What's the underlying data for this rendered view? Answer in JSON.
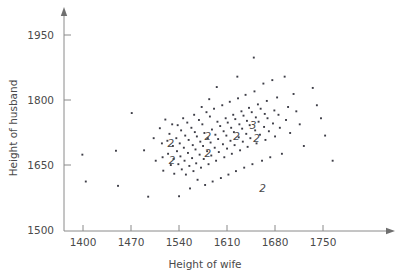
{
  "chart_data": {
    "type": "scatter",
    "title": "",
    "xlabel": "Height of wife",
    "ylabel": "Height of husband",
    "xlim": [
      1358,
      1790
    ],
    "ylim": [
      1500,
      1975
    ],
    "xticks": [
      1400,
      1470,
      1540,
      1610,
      1680,
      1750
    ],
    "yticks": [
      1500,
      1650,
      1800,
      1950
    ],
    "xtick_labels": [
      "1400",
      "1470",
      "1540",
      "1610",
      "1680",
      "1750"
    ],
    "ytick_labels": [
      "1500",
      "1650",
      "1800",
      "1950"
    ],
    "grid": false,
    "legend": false,
    "marker": "square-dot",
    "marker_color": "#3d3d46",
    "axis_color": "#8a8a8a",
    "text_color": "#4a4a4a",
    "note": "Counts greater than 1 at a coincident location are drawn as a numeral instead of a dot.",
    "points": [
      [
        1399,
        1674
      ],
      [
        1404,
        1612
      ],
      [
        1448,
        1683
      ],
      [
        1451,
        1602
      ],
      [
        1471,
        1770
      ],
      [
        1489,
        1684
      ],
      [
        1495,
        1577
      ],
      [
        1503,
        1712
      ],
      [
        1506,
        1660
      ],
      [
        1512,
        1735
      ],
      [
        1515,
        1700
      ],
      [
        1516,
        1668
      ],
      [
        1517,
        1637
      ],
      [
        1520,
        1755
      ],
      [
        1523,
        1706
      ],
      [
        1524,
        1676
      ],
      [
        1526,
        1722
      ],
      [
        1528,
        1650
      ],
      [
        1530,
        1744
      ],
      [
        1531,
        1694
      ],
      [
        1532,
        1664
      ],
      [
        1533,
        1630
      ],
      [
        1536,
        1712
      ],
      [
        1537,
        1682
      ],
      [
        1538,
        1742
      ],
      [
        1539,
        1652
      ],
      [
        1540,
        1578
      ],
      [
        1541,
        1700
      ],
      [
        1542,
        1670
      ],
      [
        1543,
        1730
      ],
      [
        1544,
        1640
      ],
      [
        1546,
        1758
      ],
      [
        1547,
        1690
      ],
      [
        1548,
        1660
      ],
      [
        1549,
        1718
      ],
      [
        1550,
        1628
      ],
      [
        1552,
        1748
      ],
      [
        1553,
        1678
      ],
      [
        1554,
        1708
      ],
      [
        1555,
        1648
      ],
      [
        1556,
        1596
      ],
      [
        1558,
        1736
      ],
      [
        1559,
        1666
      ],
      [
        1560,
        1696
      ],
      [
        1561,
        1636
      ],
      [
        1562,
        1766
      ],
      [
        1563,
        1726
      ],
      [
        1564,
        1686
      ],
      [
        1565,
        1654
      ],
      [
        1566,
        1716
      ],
      [
        1567,
        1616
      ],
      [
        1569,
        1754
      ],
      [
        1570,
        1674
      ],
      [
        1571,
        1704
      ],
      [
        1572,
        1644
      ],
      [
        1573,
        1784
      ],
      [
        1574,
        1744
      ],
      [
        1575,
        1694
      ],
      [
        1576,
        1664
      ],
      [
        1577,
        1724
      ],
      [
        1578,
        1604
      ],
      [
        1580,
        1772
      ],
      [
        1581,
        1682
      ],
      [
        1582,
        1712
      ],
      [
        1583,
        1652
      ],
      [
        1584,
        1802
      ],
      [
        1585,
        1762
      ],
      [
        1586,
        1702
      ],
      [
        1587,
        1672
      ],
      [
        1588,
        1732
      ],
      [
        1589,
        1612
      ],
      [
        1591,
        1780
      ],
      [
        1592,
        1690
      ],
      [
        1593,
        1720
      ],
      [
        1594,
        1660
      ],
      [
        1595,
        1830
      ],
      [
        1596,
        1750
      ],
      [
        1597,
        1710
      ],
      [
        1598,
        1680
      ],
      [
        1600,
        1740
      ],
      [
        1601,
        1620
      ],
      [
        1603,
        1788
      ],
      [
        1604,
        1698
      ],
      [
        1605,
        1728
      ],
      [
        1606,
        1668
      ],
      [
        1608,
        1758
      ],
      [
        1609,
        1718
      ],
      [
        1610,
        1688
      ],
      [
        1611,
        1748
      ],
      [
        1612,
        1628
      ],
      [
        1614,
        1796
      ],
      [
        1615,
        1706
      ],
      [
        1616,
        1736
      ],
      [
        1617,
        1676
      ],
      [
        1619,
        1766
      ],
      [
        1620,
        1726
      ],
      [
        1621,
        1696
      ],
      [
        1622,
        1756
      ],
      [
        1623,
        1636
      ],
      [
        1625,
        1854
      ],
      [
        1626,
        1804
      ],
      [
        1627,
        1714
      ],
      [
        1628,
        1744
      ],
      [
        1629,
        1684
      ],
      [
        1631,
        1774
      ],
      [
        1632,
        1734
      ],
      [
        1633,
        1704
      ],
      [
        1634,
        1764
      ],
      [
        1635,
        1644
      ],
      [
        1637,
        1812
      ],
      [
        1638,
        1722
      ],
      [
        1639,
        1752
      ],
      [
        1640,
        1692
      ],
      [
        1642,
        1782
      ],
      [
        1643,
        1742
      ],
      [
        1644,
        1712
      ],
      [
        1646,
        1772
      ],
      [
        1647,
        1652
      ],
      [
        1649,
        1898
      ],
      [
        1650,
        1820
      ],
      [
        1651,
        1730
      ],
      [
        1652,
        1760
      ],
      [
        1653,
        1700
      ],
      [
        1655,
        1790
      ],
      [
        1656,
        1750
      ],
      [
        1658,
        1720
      ],
      [
        1659,
        1780
      ],
      [
        1661,
        1660
      ],
      [
        1663,
        1838
      ],
      [
        1664,
        1738
      ],
      [
        1665,
        1768
      ],
      [
        1666,
        1708
      ],
      [
        1668,
        1798
      ],
      [
        1669,
        1758
      ],
      [
        1671,
        1728
      ],
      [
        1673,
        1668
      ],
      [
        1676,
        1846
      ],
      [
        1677,
        1746
      ],
      [
        1679,
        1776
      ],
      [
        1680,
        1716
      ],
      [
        1683,
        1806
      ],
      [
        1685,
        1766
      ],
      [
        1687,
        1736
      ],
      [
        1690,
        1676
      ],
      [
        1694,
        1854
      ],
      [
        1696,
        1754
      ],
      [
        1699,
        1784
      ],
      [
        1702,
        1724
      ],
      [
        1707,
        1814
      ],
      [
        1711,
        1774
      ],
      [
        1716,
        1744
      ],
      [
        1722,
        1694
      ],
      [
        1735,
        1828
      ],
      [
        1741,
        1788
      ],
      [
        1747,
        1758
      ],
      [
        1753,
        1718
      ],
      [
        1764,
        1660
      ]
    ],
    "count_labels": [
      {
        "x": 1528,
        "y": 1700,
        "count": "2"
      },
      {
        "x": 1530,
        "y": 1660,
        "count": "2"
      },
      {
        "x": 1582,
        "y": 1716,
        "count": "2"
      },
      {
        "x": 1582,
        "y": 1678,
        "count": "2"
      },
      {
        "x": 1624,
        "y": 1716,
        "count": "2"
      },
      {
        "x": 1648,
        "y": 1742,
        "count": "3"
      },
      {
        "x": 1653,
        "y": 1712,
        "count": "2"
      },
      {
        "x": 1662,
        "y": 1596,
        "count": "2"
      }
    ]
  }
}
